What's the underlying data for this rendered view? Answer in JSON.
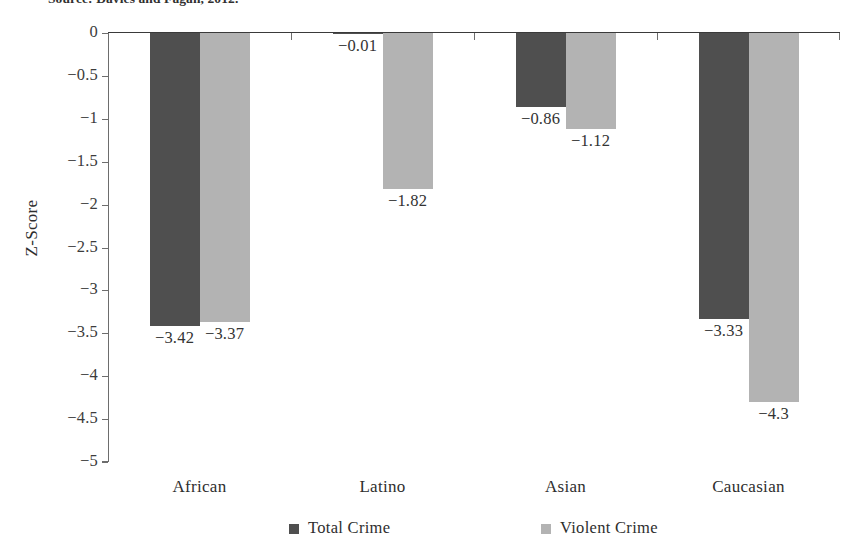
{
  "source_note": "Source: Davies and Fagan, 2012.",
  "chart_data": {
    "type": "bar",
    "title": "",
    "xlabel": "",
    "ylabel": "Z-Score",
    "ylim": [
      -5,
      0
    ],
    "yticks": [
      "0",
      "−0.5",
      "−1",
      "−1.5",
      "−2",
      "−2.5",
      "−3",
      "−3.5",
      "−4",
      "−4.5",
      "−5"
    ],
    "ytick_values": [
      0,
      -0.5,
      -1,
      -1.5,
      -2,
      -2.5,
      -3,
      -3.5,
      -4,
      -4.5,
      -5
    ],
    "grid": false,
    "legend_position": "bottom",
    "categories": [
      "African",
      "Latino",
      "Asian",
      "Caucasian"
    ],
    "series": [
      {
        "name": "Total Crime",
        "color": "#4f4f4f",
        "values": [
          -3.42,
          -0.01,
          -0.86,
          -3.33
        ],
        "labels": [
          "−3.42",
          "−0.01",
          "−0.86",
          "−3.33"
        ]
      },
      {
        "name": "Violent Crime",
        "color": "#b3b3b3",
        "values": [
          -3.37,
          -1.82,
          -1.12,
          -4.3
        ],
        "labels": [
          "−3.37",
          "−1.82",
          "−1.12",
          "−4.3"
        ]
      }
    ]
  },
  "legend": {
    "items": [
      {
        "label": "Total Crime",
        "color": "#4f4f4f"
      },
      {
        "label": "Violent Crime",
        "color": "#b3b3b3"
      }
    ]
  }
}
